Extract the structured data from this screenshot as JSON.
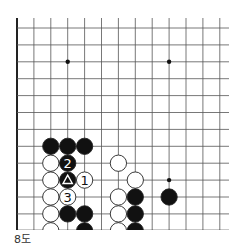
{
  "diagram": {
    "caption": "8도",
    "grid": {
      "x0": 17,
      "y0": 28,
      "spacing": 16.9,
      "cols": 13,
      "rows": 12,
      "left_edge": true,
      "bottom_edge": true,
      "top_extends_to": 18,
      "right_extends_to": 229
    },
    "star_points": [
      {
        "col": 3,
        "row": 2
      },
      {
        "col": 9,
        "row": 2
      },
      {
        "col": 9,
        "row": 9
      }
    ],
    "stones": [
      {
        "color": "black",
        "col": 2,
        "row": 7,
        "label": ""
      },
      {
        "color": "black",
        "col": 3,
        "row": 7,
        "label": ""
      },
      {
        "color": "black",
        "col": 4,
        "row": 7,
        "label": ""
      },
      {
        "color": "white",
        "col": 2,
        "row": 8,
        "label": ""
      },
      {
        "color": "black",
        "col": 3,
        "row": 8,
        "label": "2"
      },
      {
        "color": "white",
        "col": 6,
        "row": 8,
        "label": ""
      },
      {
        "color": "white",
        "col": 2,
        "row": 9,
        "label": ""
      },
      {
        "color": "black",
        "col": 3,
        "row": 9,
        "label": "triangle"
      },
      {
        "color": "white",
        "col": 4,
        "row": 9,
        "label": "1"
      },
      {
        "color": "white",
        "col": 7,
        "row": 9,
        "label": ""
      },
      {
        "color": "white",
        "col": 2,
        "row": 10,
        "label": ""
      },
      {
        "color": "white",
        "col": 3,
        "row": 10,
        "label": "3"
      },
      {
        "color": "white",
        "col": 6,
        "row": 10,
        "label": ""
      },
      {
        "color": "black",
        "col": 7,
        "row": 10,
        "label": ""
      },
      {
        "color": "black",
        "col": 9,
        "row": 10,
        "label": ""
      },
      {
        "color": "white",
        "col": 2,
        "row": 11,
        "label": ""
      },
      {
        "color": "black",
        "col": 3,
        "row": 11,
        "label": ""
      },
      {
        "color": "black",
        "col": 4,
        "row": 11,
        "label": ""
      },
      {
        "color": "white",
        "col": 6,
        "row": 11,
        "label": ""
      },
      {
        "color": "black",
        "col": 7,
        "row": 11,
        "label": ""
      },
      {
        "color": "white",
        "col": 2,
        "row": 12,
        "label": ""
      },
      {
        "color": "black",
        "col": 4,
        "row": 12,
        "label": ""
      },
      {
        "color": "white",
        "col": 6,
        "row": 12,
        "label": ""
      },
      {
        "color": "black",
        "col": 7,
        "row": 12,
        "label": ""
      }
    ],
    "colors": {
      "line": "#555555",
      "edge": "#222222",
      "black_stone": "#111111",
      "white_stone": "#ffffff",
      "stone_outline": "#222222"
    }
  }
}
